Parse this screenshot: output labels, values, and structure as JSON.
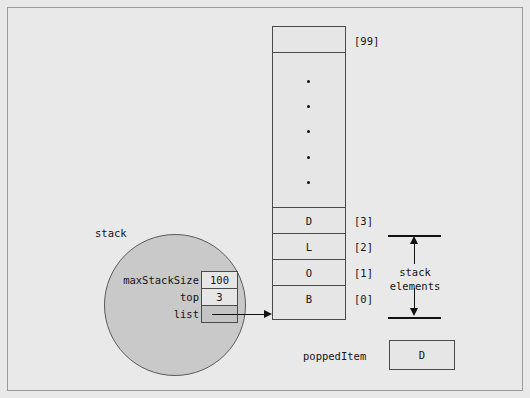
{
  "figure": {
    "background_color": "#e9e9e9",
    "border_color": "#9a9a9a"
  },
  "stack_object": {
    "label": "stack",
    "fields": [
      {
        "name": "maxStackSize",
        "value": "100",
        "shaded": false
      },
      {
        "name": "top",
        "value": "3",
        "shaded": false
      },
      {
        "name": "list",
        "value": "",
        "shaded": true
      }
    ]
  },
  "array": {
    "top_index_label": "[99]",
    "ellipsis_dots": 5,
    "cells": [
      {
        "value": "D",
        "index_label": "[3]"
      },
      {
        "value": "L",
        "index_label": "[2]"
      },
      {
        "value": "O",
        "index_label": "[1]"
      },
      {
        "value": "B",
        "index_label": "[0]"
      }
    ]
  },
  "annotation": {
    "line1": "stack",
    "line2": "elements"
  },
  "popped": {
    "label": "poppedItem",
    "value": "D"
  },
  "colors": {
    "circle_fill": "#c9c9c9",
    "box_fill": "#e6e6e6",
    "shaded_fill": "#c4c4c4",
    "stroke": "#4a4a4a",
    "arrow": "#111111"
  }
}
